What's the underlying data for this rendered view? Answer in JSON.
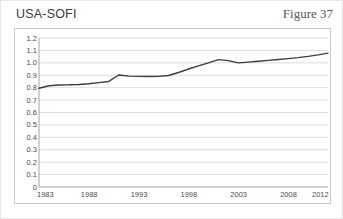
{
  "figure": {
    "title": "USA-SOFI",
    "label": "Figure 37"
  },
  "chart_data": {
    "type": "line",
    "title": "USA-SOFI",
    "xlabel": "",
    "ylabel": "",
    "xlim": [
      1983,
      2012
    ],
    "ylim": [
      0,
      1.2
    ],
    "grid": true,
    "legend": "none",
    "line_color": "#3c3c3c",
    "xticks": [
      1983,
      1988,
      1993,
      1998,
      2003,
      2008,
      2012
    ],
    "xtick_labels": [
      "1983",
      "1988",
      "1993",
      "1998",
      "2003",
      "2008",
      "2012"
    ],
    "yticks": [
      0,
      0.1,
      0.2,
      0.3,
      0.4,
      0.5,
      0.6,
      0.7,
      0.8,
      0.9,
      1.0,
      1.1,
      1.2
    ],
    "ytick_labels": [
      "0",
      "0.1",
      "0.2",
      "0.3",
      "0.4",
      "0.5",
      "0.6",
      "0.7",
      "0.8",
      "0.9",
      "1.0",
      "1.1",
      "1.2"
    ],
    "series": [
      {
        "name": "USA-SOFI",
        "x": [
          1983,
          1984,
          1985,
          1986,
          1987,
          1988,
          1989,
          1990,
          1991,
          1992,
          1993,
          1994,
          1995,
          1996,
          1997,
          1998,
          1999,
          2000,
          2001,
          2002,
          2003,
          2004,
          2005,
          2006,
          2007,
          2008,
          2009,
          2010,
          2011,
          2012
        ],
        "values": [
          0.795,
          0.815,
          0.822,
          0.823,
          0.826,
          0.832,
          0.841,
          0.85,
          0.902,
          0.893,
          0.891,
          0.89,
          0.891,
          0.898,
          0.922,
          0.95,
          0.975,
          1.0,
          1.026,
          1.018,
          1.0,
          1.006,
          1.013,
          1.02,
          1.027,
          1.034,
          1.042,
          1.052,
          1.064,
          1.078
        ]
      }
    ]
  }
}
